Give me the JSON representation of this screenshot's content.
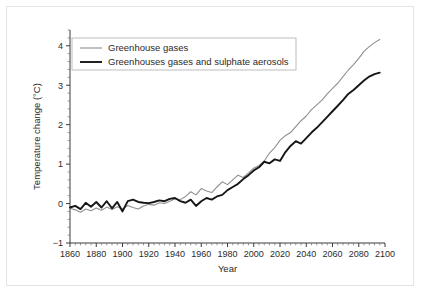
{
  "figure": {
    "background_color": "#ffffff",
    "frame_color": "#e3e3e3"
  },
  "chart_data": {
    "type": "line",
    "title": "",
    "xlabel": "Year",
    "ylabel": "Temperature change (°C)",
    "xlim": [
      1860,
      2100
    ],
    "ylim": [
      -1,
      4.4
    ],
    "y_ticks": [
      -1,
      0,
      1,
      2,
      3,
      4
    ],
    "y_tick_labels": [
      "−1",
      "0",
      "1",
      "2",
      "3",
      "4"
    ],
    "y_minor_step": 0.2,
    "x_ticks": [
      1860,
      1880,
      1900,
      1920,
      1940,
      1960,
      1980,
      2000,
      2020,
      2040,
      2060,
      2080,
      2100
    ],
    "x_tick_labels": [
      "1860",
      "1880",
      "1900",
      "1920",
      "1940",
      "1960",
      "1980",
      "2000",
      "2020",
      "2040",
      "2060",
      "2080",
      "2100"
    ],
    "x_minor_step": 4,
    "grid": false,
    "legend_position": "upper left",
    "series": [
      {
        "name": "Greenhouse gases",
        "color": "#8f8f8f",
        "width": 1.1,
        "x": [
          1860,
          1864,
          1868,
          1872,
          1876,
          1880,
          1884,
          1888,
          1892,
          1896,
          1900,
          1904,
          1908,
          1912,
          1916,
          1920,
          1924,
          1928,
          1932,
          1936,
          1940,
          1944,
          1948,
          1952,
          1956,
          1960,
          1964,
          1968,
          1972,
          1976,
          1980,
          1984,
          1988,
          1992,
          1996,
          2000,
          2004,
          2008,
          2012,
          2016,
          2020,
          2024,
          2028,
          2032,
          2036,
          2040,
          2044,
          2048,
          2052,
          2056,
          2060,
          2064,
          2068,
          2072,
          2076,
          2080,
          2084,
          2088,
          2092,
          2096
        ],
        "y": [
          -0.12,
          -0.16,
          -0.22,
          -0.14,
          -0.18,
          -0.11,
          -0.17,
          -0.09,
          -0.15,
          -0.08,
          -0.14,
          -0.05,
          -0.1,
          -0.14,
          -0.06,
          -0.02,
          -0.04,
          0.02,
          0.0,
          0.06,
          0.12,
          0.1,
          0.18,
          0.3,
          0.22,
          0.38,
          0.32,
          0.28,
          0.42,
          0.55,
          0.48,
          0.6,
          0.72,
          0.66,
          0.78,
          0.9,
          0.96,
          1.08,
          1.28,
          1.42,
          1.6,
          1.72,
          1.8,
          1.95,
          2.1,
          2.22,
          2.38,
          2.5,
          2.62,
          2.78,
          2.92,
          3.05,
          3.22,
          3.38,
          3.52,
          3.68,
          3.86,
          3.98,
          4.08,
          4.16
        ]
      },
      {
        "name": "Greenhouses gases and sulphate aerosols",
        "color": "#161616",
        "width": 1.9,
        "x": [
          1860,
          1864,
          1868,
          1872,
          1876,
          1880,
          1884,
          1888,
          1892,
          1896,
          1900,
          1904,
          1908,
          1912,
          1916,
          1920,
          1924,
          1928,
          1932,
          1936,
          1940,
          1944,
          1948,
          1952,
          1956,
          1960,
          1964,
          1968,
          1972,
          1976,
          1980,
          1984,
          1988,
          1992,
          1996,
          2000,
          2004,
          2008,
          2012,
          2016,
          2020,
          2024,
          2028,
          2032,
          2036,
          2040,
          2044,
          2048,
          2052,
          2056,
          2060,
          2064,
          2068,
          2072,
          2076,
          2080,
          2084,
          2088,
          2092,
          2096
        ],
        "y": [
          -0.1,
          -0.06,
          -0.14,
          0.02,
          -0.08,
          0.04,
          -0.1,
          0.06,
          -0.12,
          0.04,
          -0.2,
          0.06,
          0.1,
          0.04,
          0.02,
          0.01,
          0.04,
          0.08,
          0.06,
          0.12,
          0.14,
          0.06,
          0.02,
          0.1,
          -0.06,
          0.06,
          0.14,
          0.1,
          0.18,
          0.22,
          0.34,
          0.42,
          0.5,
          0.62,
          0.72,
          0.84,
          0.92,
          1.06,
          1.02,
          1.12,
          1.08,
          1.3,
          1.46,
          1.58,
          1.52,
          1.66,
          1.8,
          1.92,
          2.06,
          2.2,
          2.34,
          2.48,
          2.62,
          2.78,
          2.88,
          3.0,
          3.12,
          3.22,
          3.28,
          3.32
        ]
      }
    ]
  },
  "legend": {
    "items": [
      {
        "label": "Greenhouse gases",
        "swatch": "thin-gray-line"
      },
      {
        "label": "Greenhouses gases and sulphate aerosols",
        "swatch": "thick-black-line"
      }
    ]
  }
}
